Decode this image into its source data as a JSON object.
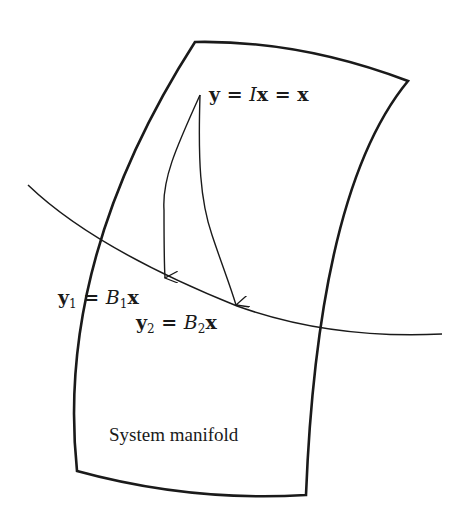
{
  "diagram": {
    "region_label": "System manifold",
    "source_point": {
      "label": "y = Ix = x",
      "parts": {
        "lhs": "y",
        "eq1": " = ",
        "op": "I",
        "var": "x",
        "eq2": " = ",
        "rhs": "x"
      }
    },
    "targets": [
      {
        "label": "y1 = B1x",
        "parts": {
          "lhs": "y",
          "sub": "1",
          "eq": " = ",
          "op": "B",
          "op_sub": "1",
          "var": "x"
        }
      },
      {
        "label": "y2 = B2x",
        "parts": {
          "lhs": "y",
          "sub": "2",
          "eq": " = ",
          "op": "B",
          "op_sub": "2",
          "var": "x"
        }
      }
    ],
    "colors": {
      "stroke": "#1a1a1a",
      "background": "#ffffff"
    }
  }
}
